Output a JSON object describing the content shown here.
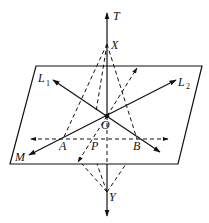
{
  "diagram": {
    "title": "",
    "plane_label": "M",
    "points": {
      "T": {
        "label": "T"
      },
      "X": {
        "label": "X"
      },
      "O": {
        "label": "O"
      },
      "Y": {
        "label": "Y"
      },
      "A": {
        "label": "A"
      },
      "P": {
        "label": "P"
      },
      "B": {
        "label": "B"
      }
    },
    "lines": {
      "L1": {
        "label": "L",
        "subscript": "1"
      },
      "L2": {
        "label": "L",
        "subscript": "2"
      }
    },
    "colors": {
      "stroke": "#111111",
      "background": "#ffffff"
    }
  }
}
